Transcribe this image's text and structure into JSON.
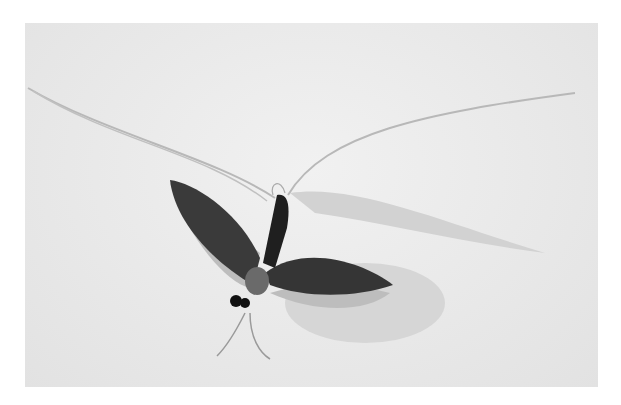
{
  "image": {
    "subject": "mayfly specimen on white background",
    "description": "Black-and-white photograph of a mayfly-like insect with dark veined wings, dark abdomen, two long trailing tail filaments, and long forelegs, casting a shadow on a pale background",
    "colors": {
      "background": "#e8e8e8",
      "frame": "#ffffff",
      "insect_dark": "#2a2a2a",
      "wing": "#3a3a3a",
      "wing_membrane": "#bdbdbd",
      "shadow": "#cfcfcf",
      "filament": "#b8b8b8"
    }
  }
}
